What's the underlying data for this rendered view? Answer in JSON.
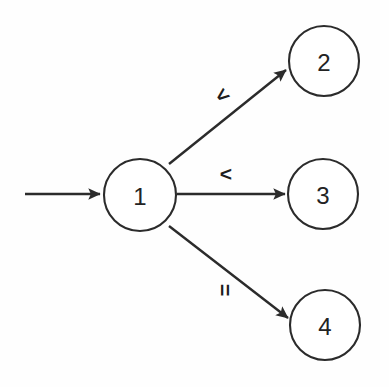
{
  "diagram": {
    "type": "directed-graph",
    "background_color": "#fefefe",
    "stroke_color": "#2b2b2b",
    "node_fill_color": "#ffffff",
    "nodes": [
      {
        "id": "1",
        "label": "1",
        "cx": 140,
        "cy": 195,
        "r": 36
      },
      {
        "id": "2",
        "label": "2",
        "cx": 324,
        "cy": 61,
        "r": 35
      },
      {
        "id": "3",
        "label": "3",
        "cx": 323,
        "cy": 194,
        "r": 35
      },
      {
        "id": "4",
        "label": "4",
        "cx": 325,
        "cy": 325,
        "r": 35
      }
    ],
    "edges": [
      {
        "id": "start-to-1",
        "from": "start",
        "to": "1",
        "label": ""
      },
      {
        "id": "1-to-2",
        "from": "1",
        "to": "2",
        "label": "<"
      },
      {
        "id": "1-to-3",
        "from": "1",
        "to": "3",
        "label": "<"
      },
      {
        "id": "1-to-4",
        "from": "1",
        "to": "4",
        "label": "="
      }
    ],
    "edge_labels": {
      "to_node_2": "<",
      "to_node_3": "<",
      "to_node_4": "="
    },
    "start_marker": {
      "name": "initial-state-arrow",
      "x_start": 25,
      "x_end": 103,
      "y": 194
    }
  }
}
